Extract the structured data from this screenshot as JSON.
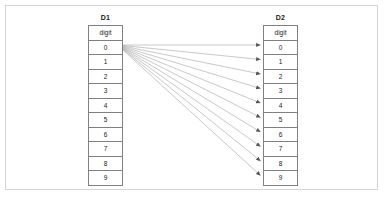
{
  "diagram": {
    "tables": [
      {
        "id": "d1",
        "title": "D1",
        "header": "digit",
        "rows": [
          "0",
          "1",
          "2",
          "3",
          "4",
          "5",
          "6",
          "7",
          "8",
          "9"
        ]
      },
      {
        "id": "d2",
        "title": "D2",
        "header": "digit",
        "rows": [
          "0",
          "1",
          "2",
          "3",
          "4",
          "5",
          "6",
          "7",
          "8",
          "9"
        ]
      }
    ],
    "connections": {
      "count": 10,
      "description": "0",
      "source_row": "0",
      "targets": [
        "0",
        "1",
        "2",
        "3",
        "4",
        "5",
        "6",
        "7",
        "8",
        "9"
      ]
    },
    "colors": {
      "frame_border": "#d5d5d5",
      "table_border": "#808080",
      "arrow": "#909090",
      "text": "#1a1a1a",
      "background": "#ffffff"
    }
  }
}
